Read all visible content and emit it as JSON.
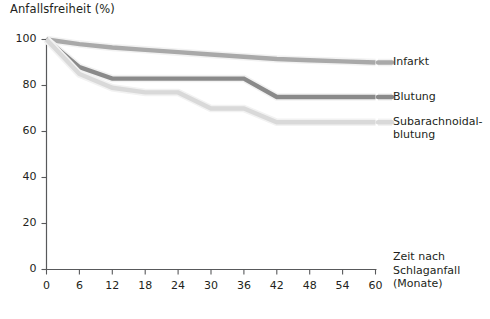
{
  "chart_data": {
    "type": "line",
    "title": "",
    "ylabel": "Anfallsfreiheit (%)",
    "xlabel": "Zeit nach Schlaganfall (Monate)",
    "xlabel_lines": [
      "Zeit nach",
      "Schlaganfall",
      "(Monate)"
    ],
    "grid": false,
    "legend_position": "right",
    "xlim": [
      0,
      60
    ],
    "ylim": [
      0,
      100
    ],
    "x": [
      0,
      6,
      12,
      18,
      24,
      30,
      36,
      42,
      48,
      54,
      60
    ],
    "xticks": [
      "0",
      "6",
      "12",
      "18",
      "24",
      "30",
      "36",
      "42",
      "48",
      "54",
      "60"
    ],
    "yticks": [
      "0",
      "20",
      "40",
      "60",
      "80",
      "100"
    ],
    "series": [
      {
        "name": "Infarkt",
        "color": "#a9a9a9",
        "values": [
          100,
          98,
          96.5,
          95.5,
          94.5,
          93.5,
          92.5,
          91.5,
          91,
          90.5,
          90
        ]
      },
      {
        "name": "Blutung",
        "color": "#8a8a8a",
        "values": [
          100,
          88,
          83,
          83,
          83,
          83,
          83,
          75,
          75,
          75,
          75
        ]
      },
      {
        "name": "Subarachnoidalblutung",
        "color": "#d9d9d9",
        "values": [
          100,
          85,
          79,
          77,
          77,
          70,
          70,
          64,
          64,
          64,
          64
        ]
      }
    ],
    "legend": [
      {
        "label": "Infarkt",
        "label_lines": [
          "Infarkt"
        ],
        "color": "#a9a9a9"
      },
      {
        "label": "Blutung",
        "label_lines": [
          "Blutung"
        ],
        "color": "#8a8a8a"
      },
      {
        "label": "Subarachnoidalblutung",
        "label_lines": [
          "Subarachnoidal-",
          "blutung"
        ],
        "color": "#d9d9d9"
      }
    ],
    "axis_color": "#58595b"
  }
}
